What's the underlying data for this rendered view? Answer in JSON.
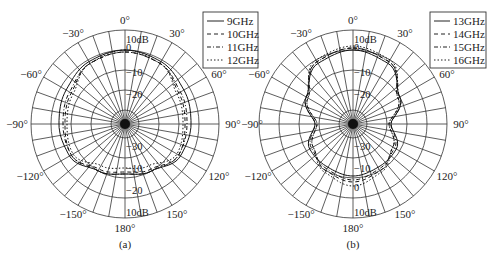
{
  "chart_data": [
    {
      "type": "polar-line",
      "panel": "(a)",
      "title": "",
      "angle_ticks": [
        "0°",
        "30°",
        "60°",
        "90°",
        "120°",
        "150°",
        "180°",
        "-150°",
        "-120°",
        "-90°",
        "-60°",
        "-30°"
      ],
      "radial_ticks": [
        "10dB",
        "0",
        "-10",
        "-20"
      ],
      "radial_range_db": [
        -30,
        10
      ],
      "grid": true,
      "legend_position": "top-right",
      "series": [
        {
          "name": "9GHz",
          "style": "solid",
          "theta_deg": [
            0,
            30,
            60,
            90,
            120,
            150,
            180,
            -150,
            -120,
            -90,
            -60,
            -30
          ],
          "gain_db": [
            0,
            -1,
            -3,
            -4,
            -5,
            -10,
            -12,
            -10,
            -5,
            -4,
            -3,
            -1
          ]
        },
        {
          "name": "10GHz",
          "style": "dashed",
          "theta_deg": [
            0,
            30,
            60,
            90,
            120,
            150,
            180,
            -150,
            -120,
            -90,
            -60,
            -30
          ],
          "gain_db": [
            -1,
            -2,
            -6,
            -7,
            -6,
            -11,
            -13,
            -11,
            -6,
            -7,
            -6,
            -2
          ]
        },
        {
          "name": "11GHz",
          "style": "dashdot",
          "theta_deg": [
            0,
            30,
            60,
            90,
            120,
            150,
            180,
            -150,
            -120,
            -90,
            -60,
            -30
          ],
          "gain_db": [
            -1,
            -2,
            -5,
            -6,
            -6,
            -10,
            -12,
            -10,
            -6,
            -6,
            -5,
            -2
          ]
        },
        {
          "name": "12GHz",
          "style": "dotted",
          "theta_deg": [
            0,
            30,
            60,
            90,
            120,
            150,
            180,
            -150,
            -120,
            -90,
            -60,
            -30
          ],
          "gain_db": [
            0,
            -2,
            -7,
            -8,
            -7,
            -13,
            -15,
            -13,
            -7,
            -8,
            -7,
            -2
          ]
        }
      ]
    },
    {
      "type": "polar-line",
      "panel": "(b)",
      "title": "",
      "angle_ticks": [
        "0°",
        "30°",
        "60°",
        "90°",
        "120°",
        "150°",
        "180°",
        "-150°",
        "-120°",
        "-90°",
        "-60°",
        "-30°"
      ],
      "radial_ticks": [
        "10dB",
        "0",
        "-10",
        "-20"
      ],
      "radial_range_db": [
        -30,
        10
      ],
      "grid": true,
      "legend_position": "top-right",
      "series": [
        {
          "name": "13GHz",
          "style": "solid",
          "theta_deg": [
            0,
            30,
            60,
            90,
            120,
            150,
            180,
            -150,
            -120,
            -90,
            -60,
            -30
          ],
          "gain_db": [
            0,
            -2,
            -10,
            -18,
            -12,
            -12,
            -11,
            -12,
            -12,
            -18,
            -10,
            -2
          ]
        },
        {
          "name": "14GHz",
          "style": "dashed",
          "theta_deg": [
            0,
            30,
            60,
            90,
            120,
            150,
            180,
            -150,
            -120,
            -90,
            -60,
            -30
          ],
          "gain_db": [
            1,
            -1,
            -11,
            -19,
            -14,
            -10,
            -8,
            -10,
            -14,
            -19,
            -11,
            -1
          ]
        },
        {
          "name": "15GHz",
          "style": "dashdot",
          "theta_deg": [
            0,
            30,
            60,
            90,
            120,
            150,
            180,
            -150,
            -120,
            -90,
            -60,
            -30
          ],
          "gain_db": [
            1,
            -1,
            -10,
            -18,
            -13,
            -11,
            -9,
            -11,
            -13,
            -18,
            -10,
            -1
          ]
        },
        {
          "name": "16GHz",
          "style": "dotted",
          "theta_deg": [
            0,
            30,
            60,
            90,
            120,
            150,
            180,
            -150,
            -120,
            -90,
            -60,
            -30
          ],
          "gain_db": [
            2,
            0,
            -11,
            -19,
            -14,
            -9,
            -6,
            -9,
            -14,
            -19,
            -11,
            0
          ]
        }
      ]
    }
  ],
  "panels": {
    "a": {
      "caption": "(a)",
      "legend": [
        "9GHz",
        "10GHz",
        "11GHz",
        "12GHz"
      ]
    },
    "b": {
      "caption": "(b)",
      "legend": [
        "13GHz",
        "14GHz",
        "15GHz",
        "16GHz"
      ]
    }
  },
  "labels": {
    "angles": {
      "a0": "0°",
      "a30": "30°",
      "a60": "60°",
      "a90": "90°",
      "a120": "120°",
      "a150": "150°",
      "a180": "180°",
      "am150": "−150°",
      "am120": "−120°",
      "am90": "−90°",
      "am60": "−60°",
      "am30": "−30°"
    },
    "radial": {
      "r10": "10dB",
      "r0": "0",
      "rm10": "−10",
      "rm20": "−20"
    }
  }
}
